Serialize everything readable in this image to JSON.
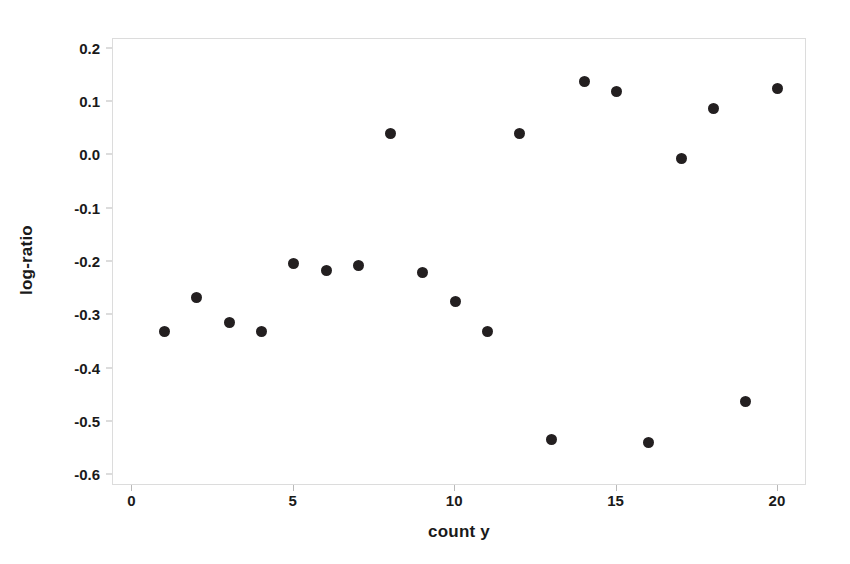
{
  "chart_data": {
    "type": "scatter",
    "title": "",
    "xlabel": "count y",
    "ylabel": "log-ratio",
    "xlim": [
      -0.6,
      20.9
    ],
    "ylim": [
      -0.62,
      0.218
    ],
    "grid": false,
    "legend": null,
    "marker": {
      "shape": "circle",
      "color": "#231f20",
      "size_px": 11
    },
    "axis": {
      "frame_color": "#dcdcdc",
      "tick_color": "#b9b9b9",
      "text_color": "#1a1a1a"
    },
    "xticks": [
      {
        "value": 0,
        "label": "0"
      },
      {
        "value": 5,
        "label": "5"
      },
      {
        "value": 10,
        "label": "10"
      },
      {
        "value": 15,
        "label": "15"
      },
      {
        "value": 20,
        "label": "20"
      }
    ],
    "yticks": [
      {
        "value": 0.2,
        "label": "0.2"
      },
      {
        "value": 0.1,
        "label": "0.1"
      },
      {
        "value": 0.0,
        "label": "0.0"
      },
      {
        "value": -0.1,
        "label": "-0.1"
      },
      {
        "value": -0.2,
        "label": "-0.2"
      },
      {
        "value": -0.3,
        "label": "-0.3"
      },
      {
        "value": -0.4,
        "label": "-0.4"
      },
      {
        "value": -0.5,
        "label": "-0.5"
      },
      {
        "value": -0.6,
        "label": "-0.6"
      }
    ],
    "x": [
      1,
      2,
      3,
      4,
      5,
      6,
      7,
      8,
      9,
      10,
      11,
      12,
      13,
      14,
      15,
      16,
      17,
      18,
      19,
      20
    ],
    "y": [
      -0.33,
      -0.267,
      -0.313,
      -0.33,
      -0.203,
      -0.216,
      -0.206,
      0.04,
      -0.219,
      -0.274,
      -0.33,
      0.04,
      -0.533,
      0.138,
      0.119,
      -0.538,
      -0.006,
      0.088,
      -0.461,
      0.126
    ],
    "points": [
      {
        "x": 1,
        "y": -0.33
      },
      {
        "x": 2,
        "y": -0.267
      },
      {
        "x": 3,
        "y": -0.313
      },
      {
        "x": 4,
        "y": -0.33
      },
      {
        "x": 5,
        "y": -0.203
      },
      {
        "x": 6,
        "y": -0.216
      },
      {
        "x": 7,
        "y": -0.206
      },
      {
        "x": 8,
        "y": 0.04
      },
      {
        "x": 9,
        "y": -0.219
      },
      {
        "x": 10,
        "y": -0.274
      },
      {
        "x": 11,
        "y": -0.33
      },
      {
        "x": 12,
        "y": 0.04
      },
      {
        "x": 13,
        "y": -0.533
      },
      {
        "x": 14,
        "y": 0.138
      },
      {
        "x": 15,
        "y": 0.119
      },
      {
        "x": 16,
        "y": -0.538
      },
      {
        "x": 17,
        "y": -0.006
      },
      {
        "x": 18,
        "y": 0.088
      },
      {
        "x": 19,
        "y": -0.461
      },
      {
        "x": 20,
        "y": 0.126
      }
    ]
  }
}
